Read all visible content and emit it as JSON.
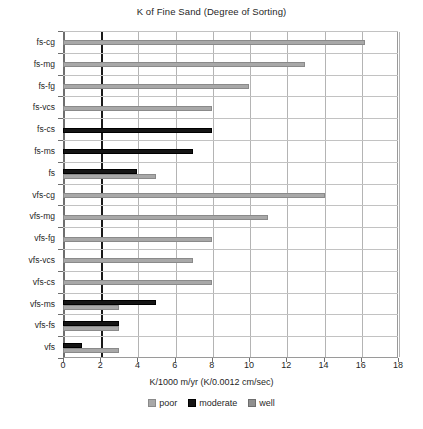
{
  "chart_data": {
    "type": "bar",
    "orientation": "horizontal",
    "title": "K of Fine Sand (Degree of Sorting)",
    "xlabel": "K/1000 m/yr (K/0.0012 cm/sec)",
    "ylabel": "",
    "xlim": [
      0,
      18
    ],
    "xticks": [
      0,
      2,
      4,
      6,
      8,
      10,
      12,
      14,
      16,
      18
    ],
    "grid": true,
    "legend_position": "bottom",
    "categories": [
      "fs-cg",
      "fs-mg",
      "fs-fg",
      "fs-vcs",
      "fs-cs",
      "fs-ms",
      "fs",
      "vfs-cg",
      "vfs-mg",
      "vfs-fg",
      "vfs-vcs",
      "vfs-cs",
      "vfs-ms",
      "vfs-fs",
      "vfs"
    ],
    "series": [
      {
        "name": "poor",
        "color": "#a8a8a8",
        "values": [
          16.2,
          13.0,
          10.0,
          8.0,
          null,
          null,
          5.0,
          14.1,
          11.0,
          8.0,
          7.0,
          8.0,
          3.0,
          3.0,
          3.0
        ]
      },
      {
        "name": "moderate",
        "color": "#151515",
        "values": [
          null,
          null,
          null,
          null,
          8.0,
          7.0,
          4.0,
          null,
          null,
          null,
          null,
          null,
          5.0,
          3.0,
          1.0
        ]
      },
      {
        "name": "well",
        "color": "#8f8f8f",
        "values": [
          null,
          null,
          null,
          null,
          null,
          null,
          null,
          null,
          null,
          null,
          null,
          null,
          null,
          null,
          null
        ]
      }
    ],
    "bars": [
      {
        "category": "fs-cg",
        "series": "poor",
        "value": 16.2
      },
      {
        "category": "fs-mg",
        "series": "poor",
        "value": 13.0
      },
      {
        "category": "fs-fg",
        "series": "poor",
        "value": 10.0
      },
      {
        "category": "fs-vcs",
        "series": "poor",
        "value": 8.0
      },
      {
        "category": "fs-cs",
        "series": "moderate",
        "value": 8.0
      },
      {
        "category": "fs-ms",
        "series": "moderate",
        "value": 7.0
      },
      {
        "category": "fs",
        "series": "moderate",
        "value": 4.0
      },
      {
        "category": "fs",
        "series": "poor",
        "value": 5.0
      },
      {
        "category": "vfs-cg",
        "series": "poor",
        "value": 14.1
      },
      {
        "category": "vfs-mg",
        "series": "poor",
        "value": 11.0
      },
      {
        "category": "vfs-fg",
        "series": "poor",
        "value": 8.0
      },
      {
        "category": "vfs-vcs",
        "series": "poor",
        "value": 7.0
      },
      {
        "category": "vfs-cs",
        "series": "poor",
        "value": 8.0
      },
      {
        "category": "vfs-ms",
        "series": "moderate",
        "value": 5.0
      },
      {
        "category": "vfs-ms",
        "series": "poor",
        "value": 3.0
      },
      {
        "category": "vfs-fs",
        "series": "moderate",
        "value": 3.0
      },
      {
        "category": "vfs-fs",
        "series": "poor",
        "value": 3.0
      },
      {
        "category": "vfs",
        "series": "moderate",
        "value": 1.0
      },
      {
        "category": "vfs",
        "series": "poor",
        "value": 3.0
      }
    ],
    "reference_line": {
      "value": 2.0,
      "color": "#1a1a1a"
    }
  },
  "legend": {
    "items": [
      {
        "label": "poor",
        "key": "poor"
      },
      {
        "label": "moderate",
        "key": "moderate"
      },
      {
        "label": "well",
        "key": "well"
      }
    ]
  },
  "caption": ""
}
